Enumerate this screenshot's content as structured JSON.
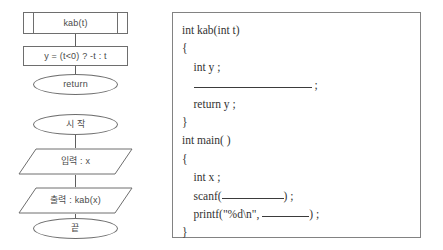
{
  "flowchart": {
    "function_diagram": {
      "subroutine_label": "kab(t)",
      "process_label": "y = (t<0) ? -t : t",
      "terminator_label": "return"
    },
    "main_diagram": {
      "start_label": "시 작",
      "input_label": "입력 : x",
      "output_label": "출력 : kab(x)",
      "end_label": "끝"
    }
  },
  "code_panel": {
    "lines": [
      {
        "text": "int kab(int t)",
        "blank": "none"
      },
      {
        "text": "{",
        "blank": "none"
      },
      {
        "text": "    int y ;",
        "blank": "none"
      },
      {
        "prefix": "    ",
        "blank": "long",
        "suffix": " ;"
      },
      {
        "text": "    return y ;",
        "blank": "none"
      },
      {
        "text": "}",
        "blank": "none"
      },
      {
        "text": "int main( )",
        "blank": "none"
      },
      {
        "text": "{",
        "blank": "none"
      },
      {
        "text": "    int x ;",
        "blank": "none"
      },
      {
        "prefix": "    scanf(",
        "blank": "mid",
        "suffix": ") ;"
      },
      {
        "prefix": "    printf(\"%d\\n\", ",
        "blank": "short",
        "suffix": ") ;"
      },
      {
        "text": "}",
        "blank": "none"
      }
    ]
  },
  "colors": {
    "stroke": "#6e6e6e",
    "panel_border": "#828282",
    "text": "#3a3a3a",
    "background": "#ffffff"
  }
}
